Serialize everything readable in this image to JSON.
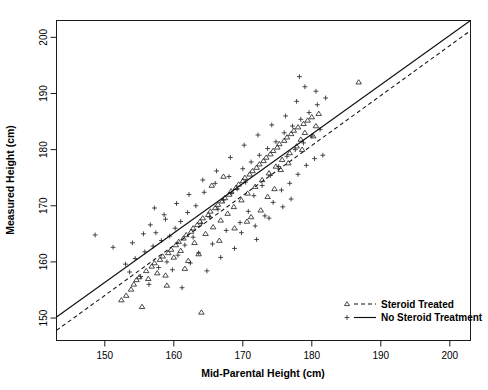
{
  "chart_data": {
    "type": "scatter",
    "title": "",
    "xlabel": "Mid-Parental Height (cm)",
    "ylabel": "Measured Height (cm)",
    "xlim": [
      143,
      203
    ],
    "ylim": [
      146,
      203
    ],
    "xticks": [
      150,
      160,
      170,
      180,
      190,
      200
    ],
    "yticks": [
      150,
      160,
      170,
      180,
      190,
      200
    ],
    "xtick_labels": [
      "150",
      "160",
      "170",
      "180",
      "190",
      "200"
    ],
    "ytick_labels": [
      "150",
      "160",
      "170",
      "180",
      "190",
      "200"
    ],
    "grid": false,
    "legend_position": "bottom-right",
    "series": [
      {
        "name": "Steroid Treated",
        "marker": "triangle",
        "line_style": "dashed",
        "points": [
          [
            152.4,
            153.2
          ],
          [
            153.1,
            154.0
          ],
          [
            153.8,
            155.1
          ],
          [
            154.2,
            156.0
          ],
          [
            154.6,
            156.8
          ],
          [
            155.0,
            157.3
          ],
          [
            155.4,
            152.0
          ],
          [
            156.0,
            158.4
          ],
          [
            156.3,
            157.0
          ],
          [
            156.8,
            159.2
          ],
          [
            157.2,
            159.8
          ],
          [
            157.6,
            158.0
          ],
          [
            158.0,
            160.4
          ],
          [
            158.4,
            161.0
          ],
          [
            158.8,
            157.6
          ],
          [
            159.2,
            161.6
          ],
          [
            159.6,
            162.2
          ],
          [
            160.0,
            160.8
          ],
          [
            160.3,
            163.0
          ],
          [
            160.7,
            163.6
          ],
          [
            161.0,
            162.0
          ],
          [
            161.4,
            164.2
          ],
          [
            161.8,
            164.8
          ],
          [
            162.1,
            160.2
          ],
          [
            162.5,
            165.4
          ],
          [
            162.8,
            166.0
          ],
          [
            163.0,
            163.4
          ],
          [
            163.4,
            166.6
          ],
          [
            163.8,
            167.2
          ],
          [
            164.0,
            151.0
          ],
          [
            164.2,
            167.8
          ],
          [
            164.6,
            165.0
          ],
          [
            165.0,
            168.4
          ],
          [
            165.3,
            169.0
          ],
          [
            165.7,
            166.2
          ],
          [
            166.0,
            169.6
          ],
          [
            166.4,
            170.2
          ],
          [
            166.8,
            167.4
          ],
          [
            167.0,
            170.8
          ],
          [
            167.4,
            171.4
          ],
          [
            167.8,
            168.6
          ],
          [
            168.0,
            172.0
          ],
          [
            168.3,
            172.6
          ],
          [
            168.7,
            169.8
          ],
          [
            169.0,
            173.2
          ],
          [
            169.4,
            173.8
          ],
          [
            169.8,
            171.0
          ],
          [
            170.0,
            174.4
          ],
          [
            170.3,
            175.0
          ],
          [
            170.7,
            172.2
          ],
          [
            171.0,
            175.6
          ],
          [
            171.4,
            176.2
          ],
          [
            171.8,
            173.4
          ],
          [
            172.0,
            176.8
          ],
          [
            172.4,
            177.4
          ],
          [
            172.8,
            174.6
          ],
          [
            173.0,
            178.0
          ],
          [
            173.4,
            178.6
          ],
          [
            173.8,
            175.8
          ],
          [
            174.0,
            179.2
          ],
          [
            174.4,
            179.8
          ],
          [
            174.8,
            177.0
          ],
          [
            175.0,
            180.4
          ],
          [
            175.3,
            181.0
          ],
          [
            175.7,
            178.2
          ],
          [
            176.0,
            181.6
          ],
          [
            176.4,
            182.2
          ],
          [
            176.8,
            179.4
          ],
          [
            177.0,
            182.8
          ],
          [
            177.4,
            183.4
          ],
          [
            177.8,
            180.6
          ],
          [
            178.0,
            184.0
          ],
          [
            178.4,
            181.8
          ],
          [
            178.8,
            184.6
          ],
          [
            179.0,
            183.0
          ],
          [
            179.4,
            185.2
          ],
          [
            180.0,
            185.8
          ],
          [
            180.6,
            184.2
          ],
          [
            181.0,
            186.4
          ],
          [
            186.8,
            192.0
          ],
          [
            165.5,
            173.6
          ],
          [
            167.2,
            175.2
          ],
          [
            171.2,
            168.0
          ],
          [
            173.6,
            171.6
          ],
          [
            175.5,
            176.4
          ],
          [
            163.6,
            161.4
          ],
          [
            161.6,
            158.8
          ],
          [
            159.0,
            155.8
          ],
          [
            166.6,
            163.8
          ],
          [
            168.8,
            166.0
          ],
          [
            170.6,
            167.2
          ],
          [
            172.6,
            169.2
          ],
          [
            174.6,
            173.0
          ],
          [
            176.6,
            177.6
          ],
          [
            178.6,
            180.0
          ],
          [
            180.2,
            182.4
          ]
        ]
      },
      {
        "name": "No Steroid Treatment",
        "marker": "plus",
        "line_style": "solid",
        "points": [
          [
            148.6,
            164.8
          ],
          [
            151.2,
            162.6
          ],
          [
            153.0,
            159.6
          ],
          [
            153.6,
            158.2
          ],
          [
            154.4,
            160.6
          ],
          [
            155.2,
            157.4
          ],
          [
            155.8,
            161.8
          ],
          [
            156.4,
            156.0
          ],
          [
            156.6,
            166.6
          ],
          [
            157.0,
            162.8
          ],
          [
            157.4,
            165.2
          ],
          [
            157.8,
            159.0
          ],
          [
            158.2,
            163.8
          ],
          [
            158.6,
            168.4
          ],
          [
            159.0,
            160.0
          ],
          [
            159.4,
            164.6
          ],
          [
            159.8,
            158.6
          ],
          [
            160.2,
            166.0
          ],
          [
            160.6,
            161.2
          ],
          [
            161.0,
            167.2
          ],
          [
            161.2,
            155.4
          ],
          [
            161.6,
            163.0
          ],
          [
            162.0,
            168.8
          ],
          [
            162.4,
            159.8
          ],
          [
            162.8,
            164.4
          ],
          [
            163.2,
            170.0
          ],
          [
            163.6,
            161.6
          ],
          [
            164.0,
            166.8
          ],
          [
            164.4,
            172.4
          ],
          [
            164.8,
            158.4
          ],
          [
            165.2,
            168.0
          ],
          [
            165.6,
            163.2
          ],
          [
            166.0,
            174.0
          ],
          [
            166.4,
            169.4
          ],
          [
            166.8,
            160.8
          ],
          [
            167.2,
            171.0
          ],
          [
            167.6,
            165.6
          ],
          [
            168.0,
            175.2
          ],
          [
            168.4,
            172.2
          ],
          [
            168.8,
            162.4
          ],
          [
            169.2,
            173.0
          ],
          [
            169.6,
            167.0
          ],
          [
            170.0,
            176.6
          ],
          [
            170.4,
            174.2
          ],
          [
            170.8,
            169.0
          ],
          [
            171.2,
            177.8
          ],
          [
            171.6,
            171.8
          ],
          [
            172.0,
            164.0
          ],
          [
            172.4,
            179.0
          ],
          [
            172.8,
            173.6
          ],
          [
            173.2,
            168.2
          ],
          [
            173.6,
            180.2
          ],
          [
            174.0,
            175.4
          ],
          [
            174.4,
            170.6
          ],
          [
            174.8,
            181.4
          ],
          [
            175.2,
            177.0
          ],
          [
            175.6,
            172.8
          ],
          [
            176.0,
            183.0
          ],
          [
            176.4,
            178.8
          ],
          [
            176.8,
            174.0
          ],
          [
            177.2,
            184.2
          ],
          [
            177.6,
            180.0
          ],
          [
            178.0,
            175.6
          ],
          [
            178.4,
            185.4
          ],
          [
            178.8,
            181.2
          ],
          [
            179.2,
            177.2
          ],
          [
            179.6,
            186.6
          ],
          [
            180.0,
            182.4
          ],
          [
            180.4,
            178.4
          ],
          [
            180.8,
            188.0
          ],
          [
            181.2,
            183.6
          ],
          [
            181.6,
            179.0
          ],
          [
            182.0,
            189.2
          ],
          [
            178.2,
            193.0
          ],
          [
            179.0,
            191.2
          ],
          [
            180.6,
            190.4
          ],
          [
            177.8,
            188.6
          ],
          [
            176.2,
            186.0
          ],
          [
            174.2,
            184.4
          ],
          [
            172.2,
            182.6
          ],
          [
            170.2,
            180.8
          ],
          [
            168.2,
            178.6
          ],
          [
            166.2,
            176.2
          ],
          [
            164.2,
            174.6
          ],
          [
            162.2,
            172.0
          ],
          [
            160.4,
            170.4
          ],
          [
            158.8,
            167.6
          ],
          [
            157.2,
            169.6
          ],
          [
            155.6,
            165.0
          ],
          [
            154.0,
            163.4
          ],
          [
            169.8,
            165.2
          ],
          [
            171.8,
            166.4
          ],
          [
            173.8,
            167.8
          ],
          [
            175.8,
            169.8
          ],
          [
            177.0,
            171.2
          ]
        ]
      }
    ],
    "fit_lines": [
      {
        "name": "Steroid Treated",
        "style": "dashed",
        "x_start": 143.0,
        "y_start": 147.8,
        "x_end": 203.0,
        "y_end": 201.2
      },
      {
        "name": "No Steroid Treatment",
        "style": "solid",
        "x_start": 143.0,
        "y_start": 150.2,
        "x_end": 203.0,
        "y_end": 203.0
      }
    ],
    "legend": [
      {
        "label": "Steroid Treated",
        "marker": "triangle",
        "line_style": "dashed"
      },
      {
        "label": "No Steroid Treatment",
        "marker": "plus",
        "line_style": "solid"
      }
    ]
  }
}
